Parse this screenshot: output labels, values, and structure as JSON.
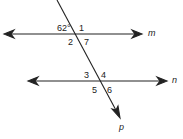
{
  "diagram": {
    "lines": [
      {
        "name": "m",
        "label": "m",
        "type": "parallel"
      },
      {
        "name": "n",
        "label": "n",
        "type": "parallel"
      },
      {
        "name": "p",
        "label": "p",
        "type": "transversal"
      }
    ],
    "given_angle": "62°",
    "angle_labels": [
      "1",
      "2",
      "7",
      "3",
      "4",
      "5",
      "6"
    ],
    "colors": {
      "stroke": "#222222",
      "background": "#ffffff"
    }
  }
}
